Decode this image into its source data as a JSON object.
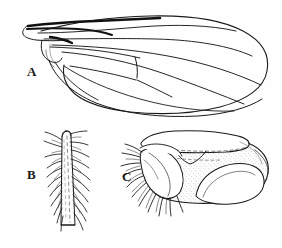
{
  "figure": {
    "type": "scientific-line-drawing",
    "background_color": "#fefefe",
    "ink_color": "#1a1a1a",
    "stipple_color": "#7a7a7a",
    "width": 282,
    "height": 248,
    "panels": [
      {
        "id": "a",
        "label": "A",
        "label_position": {
          "x": 27,
          "y": 65
        },
        "description": "wing, dorsal view",
        "features": [
          "thickened dark costal margin at base",
          "basal alula lobe",
          "longitudinal veins",
          "discal cell with crossveins",
          "rounded apex"
        ]
      },
      {
        "id": "b",
        "label": "B",
        "label_position": {
          "x": 27,
          "y": 168
        },
        "description": "tapering leg segment with bristles",
        "features": [
          "elongate tapering segment",
          "dashed median line",
          "lateral bristle rows"
        ]
      },
      {
        "id": "c",
        "label": "C",
        "label_position": {
          "x": 122,
          "y": 170
        },
        "description": "terminal abdominal segment, lateral view",
        "features": [
          "stippled surface",
          "upper curved flap with dashed suture",
          "fringe of bristles on anterior lobe",
          "pale ventral lobe"
        ]
      }
    ]
  }
}
